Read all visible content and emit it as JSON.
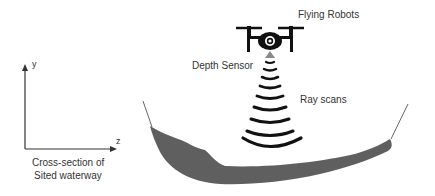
{
  "labels": {
    "flying_robots": "Flying Robots",
    "depth_sensor": "Depth Sensor",
    "ray_scans": "Ray scans",
    "axis_y": "y",
    "axis_z": "z",
    "caption_line1": "Cross-section of",
    "caption_line2": "Sited waterway"
  },
  "colors": {
    "terrain": "#5f5f5f",
    "drone": "#111111",
    "rays": "#111111",
    "text": "#333333"
  }
}
